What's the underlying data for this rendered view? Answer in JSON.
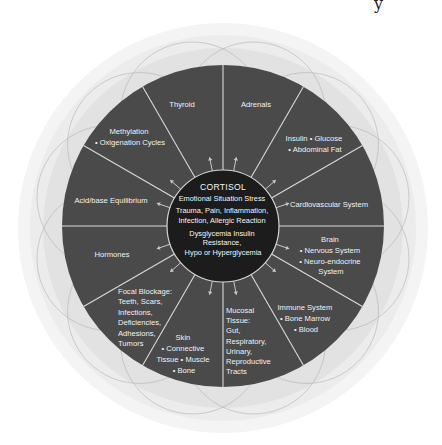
{
  "diagram": {
    "colors": {
      "background": "#ffffff",
      "outer_halo": "#e4e4e4",
      "halo_lines": "#b9b9b9",
      "wheel_fill": "#4a4a4a",
      "spoke_lines": "#d9d9d9",
      "center_fill": "#1c1c1c",
      "arrows": "#c8c8c8",
      "text": "#f2f2f2"
    },
    "corner_fragment": "y",
    "center": {
      "title": "CORTISOL",
      "lines": [
        "Emotional Situation Stress",
        "Trauma, Pain, Inflammation,",
        "Infection, Allergic Reaction",
        "Dysglycemia Insulin",
        "Resistance,",
        "Hypo or Hyperglycemia"
      ]
    },
    "segments": [
      {
        "id": "thyroid",
        "lines": [
          "Thyroid"
        ]
      },
      {
        "id": "adrenals",
        "lines": [
          "Adrenals"
        ]
      },
      {
        "id": "insulin",
        "lines": [
          "Insulin • Glucose",
          "• Abdominal Fat"
        ]
      },
      {
        "id": "cardiovascular",
        "lines": [
          "Cardiovascular System"
        ]
      },
      {
        "id": "brain",
        "lines": [
          "Brain",
          "• Nervous System",
          "• Neuro-endocrine",
          "System"
        ]
      },
      {
        "id": "immune",
        "lines": [
          "Immune System",
          "• Bone Marrow",
          "• Blood"
        ]
      },
      {
        "id": "mucosal",
        "lines": [
          "Mucosal",
          "Tissue:",
          "Gut,",
          "Respiratory,",
          "Urinary,",
          "Reproductive",
          "Tracts"
        ]
      },
      {
        "id": "skin",
        "lines": [
          "Skin",
          "• Connective",
          "Tissue • Muscle",
          "• Bone"
        ]
      },
      {
        "id": "focal",
        "lines": [
          "Focal Blockage:",
          "Teeth, Scars,",
          "Infections,",
          "Deficiencies,",
          "Adhesions,",
          "Tumors"
        ]
      },
      {
        "id": "hormones",
        "lines": [
          "Hormones"
        ]
      },
      {
        "id": "acidbase",
        "lines": [
          "Acid/base Equilibrium"
        ]
      },
      {
        "id": "methylation",
        "lines": [
          "Methylation",
          "• Oxigenation Cycles"
        ]
      }
    ]
  }
}
